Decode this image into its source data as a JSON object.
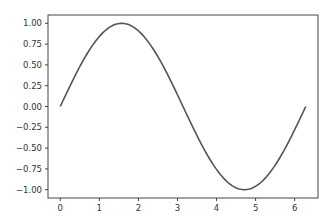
{
  "chart_data": {
    "type": "line",
    "title": "",
    "xlabel": "",
    "ylabel": "",
    "xlim": [
      -0.314,
      6.597
    ],
    "ylim": [
      -1.1,
      1.1
    ],
    "grid": false,
    "legend": null,
    "x_ticks": [
      "0",
      "1",
      "2",
      "3",
      "4",
      "5",
      "6"
    ],
    "y_ticks": [
      "1.00",
      "0.75",
      "0.50",
      "0.25",
      "0.00",
      "−0.25",
      "−0.50",
      "−0.75",
      "−1.00"
    ],
    "series": [
      {
        "name": "sin(x)",
        "color": "#555555",
        "function": "sin(x)",
        "x": [
          0,
          0.5,
          1.0,
          1.5708,
          2.0,
          2.5,
          3.1416,
          3.5,
          4.0,
          4.7124,
          5.0,
          5.5,
          6.2832
        ],
        "y": [
          0,
          0.479,
          0.841,
          1.0,
          0.909,
          0.598,
          0.0,
          -0.351,
          -0.757,
          -1.0,
          -0.959,
          -0.706,
          0.0
        ]
      }
    ]
  }
}
